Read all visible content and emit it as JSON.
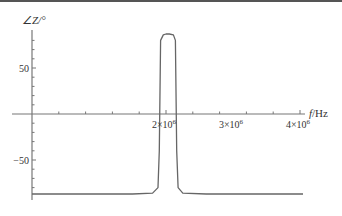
{
  "chart_data": {
    "type": "line",
    "title": "",
    "xlabel": "f/Hz",
    "ylabel": "∠Z/°",
    "x_ticks": [
      {
        "value": 2000000,
        "label_base": "2×10",
        "label_exp": "6"
      },
      {
        "value": 3000000,
        "label_base": "3×10",
        "label_exp": "6"
      },
      {
        "value": 4000000,
        "label_base": "4×10",
        "label_exp": "6"
      }
    ],
    "y_ticks": [
      {
        "value": 50,
        "label": "50"
      },
      {
        "value": -50,
        "label": "-50"
      }
    ],
    "xlim": [
      0,
      4200000
    ],
    "ylim": [
      -95,
      95
    ],
    "grid": false,
    "legend": null,
    "series": [
      {
        "name": "phase",
        "color": "#666666",
        "x": [
          0,
          1500000,
          1800000,
          1880000,
          1900000,
          1920000,
          1960000,
          2000000,
          2050000,
          2110000,
          2140000,
          2160000,
          2180000,
          2250000,
          2600000,
          3500000,
          4250000
        ],
        "y": [
          -87,
          -87,
          -86,
          -80,
          -40,
          80,
          86,
          87,
          87,
          86,
          80,
          -40,
          -80,
          -86,
          -87,
          -87,
          -87
        ]
      }
    ]
  }
}
